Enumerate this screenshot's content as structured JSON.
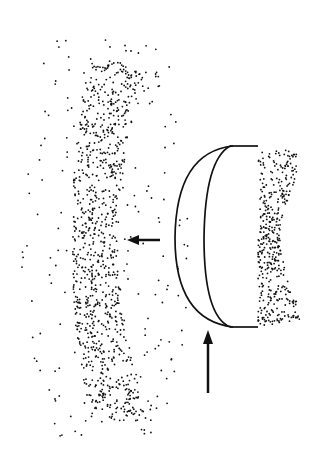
{
  "figure": {
    "type": "stipple-illustration",
    "background": "#ffffff",
    "ink": "#111111",
    "elements": {
      "lens_body": "half-dome lens shape with two curved outlines, flat right edge",
      "right_cluster": "dense stipple cluster right of lens",
      "left_band": "dense vertical stipple band on left",
      "scatter": "sparse scattered dots around the band",
      "arrow_left": {
        "from": [
          160,
          240
        ],
        "to": [
          127,
          240
        ]
      },
      "arrow_up": {
        "from": [
          208,
          393
        ],
        "to": [
          208,
          330
        ]
      }
    }
  }
}
